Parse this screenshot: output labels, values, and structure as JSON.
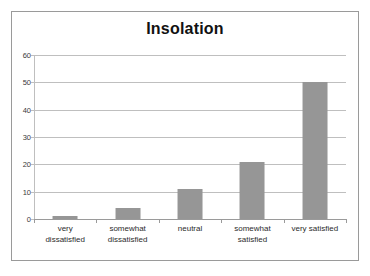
{
  "chart_data": {
    "type": "bar",
    "title": "Insolation",
    "xlabel": "",
    "ylabel": "",
    "categories": [
      "very dissatisfied",
      "somewhat dissatisfied",
      "neutral",
      "somewhat satisfied",
      "very satisfied"
    ],
    "category_lines": [
      [
        "very",
        "dissatisfied"
      ],
      [
        "somewhat",
        "dissatisfied"
      ],
      [
        "neutral"
      ],
      [
        "somewhat",
        "satisfied"
      ],
      [
        "very satisfied"
      ]
    ],
    "values": [
      1,
      4,
      11,
      21,
      50
    ],
    "ylim": [
      0,
      60
    ],
    "yticks": [
      0,
      10,
      20,
      30,
      40,
      50,
      60
    ],
    "ytick_labels": [
      "0",
      "10",
      "20",
      "30",
      "40",
      "50",
      "60"
    ],
    "grid": true,
    "legend": false,
    "legend_position": "none",
    "colors": {
      "bar_fill": "#969696",
      "gridline": "#bfbfbf",
      "axis": "#9a9a9a",
      "frame_border": "#9a9a9a",
      "plot_background": "#ffffff",
      "title_text": "#111111",
      "tick_text": "#3a3a3a"
    }
  }
}
